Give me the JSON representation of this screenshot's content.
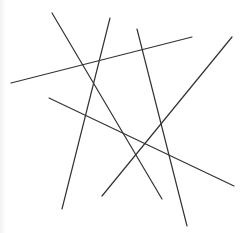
{
  "canvas": {
    "width": 249,
    "height": 233,
    "background": "#ffffff"
  },
  "stroke": {
    "color": "#333333",
    "width": 1.2
  },
  "lines": [
    {
      "id": "line-a",
      "x1": 52,
      "y1": 13,
      "x2": 162,
      "y2": 199
    },
    {
      "id": "line-b",
      "x1": 110,
      "y1": 18,
      "x2": 62,
      "y2": 209
    },
    {
      "id": "line-c",
      "x1": 11,
      "y1": 83,
      "x2": 192,
      "y2": 37
    },
    {
      "id": "line-d",
      "x1": 49,
      "y1": 98,
      "x2": 234,
      "y2": 186
    },
    {
      "id": "line-e",
      "x1": 137,
      "y1": 29,
      "x2": 187,
      "y2": 226
    },
    {
      "id": "line-f",
      "x1": 232,
      "y1": 37,
      "x2": 102,
      "y2": 196
    }
  ]
}
